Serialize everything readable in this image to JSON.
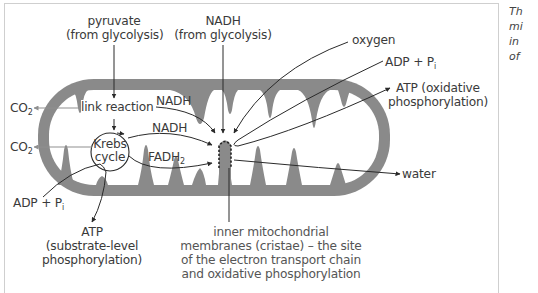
{
  "diagram": {
    "type": "mitochondrion-respiration-flow",
    "colors": {
      "membrane": "#8a8a8a",
      "text": "#3a3a3a",
      "arrow": "#2a2a2a",
      "co2_arrow": "#8f8f8f",
      "frame": "#cfcfcf"
    },
    "labels": {
      "pyruvate_line1": "pyruvate",
      "pyruvate_line2": "(from glycolysis)",
      "nadh_glyc_line1": "NADH",
      "nadh_glyc_line2": "(from glycolysis)",
      "oxygen": "oxygen",
      "adp_pi_right": "ADP + P",
      "adp_pi_right_sub": "i",
      "atp_ox_line1": "ATP (oxidative",
      "atp_ox_line2": "phosphorylation)",
      "co2_top": "CO",
      "co2_top_sub": "2",
      "co2_bottom": "CO",
      "co2_bottom_sub": "2",
      "link_reaction": "link reaction",
      "nadh_1": "NADH",
      "nadh_2": "NADH",
      "krebs_line1": "Krebs",
      "krebs_line2": "cycle",
      "fadh2": "FADH",
      "fadh2_sub": "2",
      "water": "water",
      "adp_pi_left": "ADP + P",
      "adp_pi_left_sub": "i",
      "atp_sub_line1": "ATP",
      "atp_sub_line2": "(substrate-level",
      "atp_sub_line3": "phosphorylation)",
      "cristae_line1": "inner mitochondrial",
      "cristae_line2": "membranes (cristae) – the site",
      "cristae_line3": "of the electron transport chain",
      "cristae_line4": "and oxidative phosphorylation"
    },
    "side_caption_fragments": [
      "Th",
      "mi",
      "in",
      "of"
    ]
  }
}
